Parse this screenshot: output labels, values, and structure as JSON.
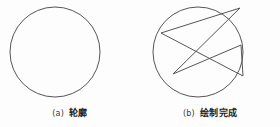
{
  "figure": {
    "background_color": "#fdfdfd",
    "stroke_color": "#555555",
    "stroke_width": 1,
    "width": 280,
    "height": 127
  },
  "subfigures": [
    {
      "id": "a",
      "caption_label": "(a)",
      "caption_text": "轮廓",
      "shape": "circle-outline",
      "circle": {
        "cx": 55,
        "cy": 52,
        "r": 45
      },
      "has_star": false
    },
    {
      "id": "b",
      "caption_label": "(b)",
      "caption_text": "绘制完成",
      "shape": "circle-with-inscribed-pentagram",
      "circle": {
        "cx": 58,
        "cy": 52,
        "r": 45
      },
      "has_star": true,
      "star": {
        "points": 5,
        "rotation_deg": 18,
        "vertex_order": [
          0,
          2,
          4,
          1,
          3
        ],
        "vertices": [
          {
            "x": 100,
            "y": 8
          },
          {
            "x": 103,
            "y": 76
          },
          {
            "x": 33,
            "y": 74
          },
          {
            "x": 21,
            "y": 33
          },
          {
            "x": 101,
            "y": 45
          }
        ]
      }
    }
  ]
}
